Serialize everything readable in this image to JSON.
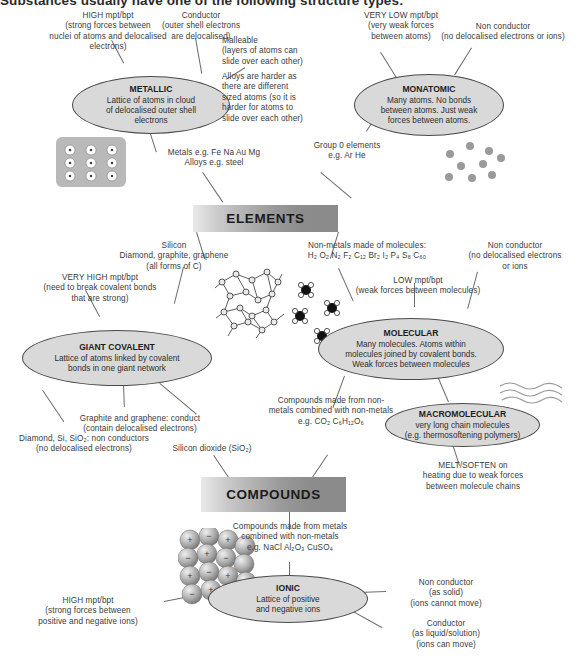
{
  "heading": {
    "text": "Substances usually have one of the following structure types:"
  },
  "banners": [
    {
      "id": "elements",
      "label": "ELEMENTS"
    },
    {
      "id": "compounds",
      "label": "COMPOUNDS"
    }
  ],
  "nodes": [
    {
      "id": "metallic",
      "title": "METALLIC",
      "body": "Lattice of atoms in cloud\nof delocalised outer shell\nelectrons"
    },
    {
      "id": "monatomic",
      "title": "MONATOMIC",
      "body": "Many atoms. No bonds\nbetween atoms. Just weak\nforces between atoms."
    },
    {
      "id": "giant-covalent",
      "title": "GIANT COVALENT",
      "body": "Lattice of atoms linked by covalent\nbonds in one giant network"
    },
    {
      "id": "molecular",
      "title": "MOLECULAR",
      "body": "Many molecules. Atoms within\nmolecules joined by covalent bonds.\nWeak forces between molecules"
    },
    {
      "id": "macromolecular",
      "title": "MACROMOLECULAR",
      "body": "very long chain molecules\n(e.g. thermosoftening polymers)"
    },
    {
      "id": "ionic",
      "title": "IONIC",
      "body": "Lattice of positive\nand negative ions"
    }
  ],
  "annotations": {
    "metallic_high_mpt": "HIGH mpt/bpt\n(strong forces between\nnuclei of atoms and delocalised\nelectrons)",
    "metallic_conductor": "Conductor\n(outer shell electrons\nare delocalised)",
    "metallic_malleable": "Malleable\n(layers of atoms can\nslide over each other)",
    "metallic_alloys": "Alloys are harder as\nthere are different\nsized atoms (so it is\nharder for atoms to\nslide over each other)",
    "metals_examples": "Metals  e.g. Fe  Na  Au  Mg\nAlloys  e.g. steel",
    "monatomic_very_low_mpt": "VERY LOW mpt/bpt\n(very weak forces\nbetween atoms)",
    "monatomic_non_conductor": "Non conductor\n(no delocalised electrons or ions)",
    "group0_examples": "Group 0 elements\ne.g. Ar He",
    "silicon_label": "Silicon\nDiamond, graphite, graphene\n(all forms of C)",
    "nonmetals_molecules_label": "Non-metals made of molecules:",
    "nonmetals_formulae": "H₂  O₂  N₂  F₂  C₁₂  Br₂  I₂  P₄  S₈  C₆₀",
    "molecular_non_conductor": "Non conductor\n(no delocalised electrons\nor ions",
    "molecular_low_mpt": "LOW mpt/bpt\n(weak forces between molecules)",
    "giant_very_high_mpt": "VERY HIGH mpt/bpt\n(need to break covalent bonds\nthat are strong)",
    "graphite_conduct": "Graphite and graphene: conduct\n(contain delocalised electrons)",
    "diamond_non_conductors": "Diamond, Si, SiO₂: non conductors\n(no delocalised electrons)",
    "silicon_dioxide": "Silicon dioxide (SiO₂)",
    "compounds_from_nonmetals": "Compounds made from non-\nmetals combined with non-metals\ne.g. CO₂  C₆H₁₂O₆",
    "macromolecular_melt": "MELT/SOFTEN on\nheating due to weak forces\nbetween molecule chains",
    "compounds_from_metals": "Compounds made from metals\ncombined with non-metals\ne.g. NaCl  Al₂O₃  CuSO₄",
    "ionic_high_mpt": "HIGH mpt/bpt\n(strong forces between\npositive and negative ions)",
    "ionic_non_conductor": "Non conductor\n(as solid)\n(ions cannot move)",
    "ionic_conductor": "Conductor\n(as liquid/solution)\n(ions can move)"
  },
  "illustrations": [
    {
      "id": "metal-lattice-image",
      "alt": "metallic lattice of positive ions in a sea of electrons"
    },
    {
      "id": "monatomic-atoms-image",
      "alt": "scattered separate atoms"
    },
    {
      "id": "giant-covalent-network-image",
      "alt": "giant covalent network of bonded atoms"
    },
    {
      "id": "molecules-image",
      "alt": "separate small molecules"
    },
    {
      "id": "polymer-chains-image",
      "alt": "long wavy polymer chains"
    },
    {
      "id": "ionic-lattice-image",
      "alt": "ionic lattice of positive and negative ions"
    }
  ],
  "colors": {
    "node_fill": "#d9d9d9",
    "node_stroke": "#4a4a4a",
    "banner_dark": "#8a8a8a",
    "text": "#3a3a3a"
  }
}
